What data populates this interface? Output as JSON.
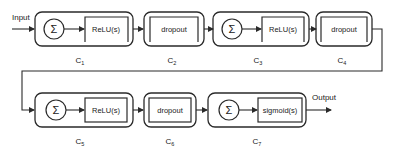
{
  "diagram": {
    "input_label": "Input",
    "output_label": "Output",
    "colors": {
      "stroke": "#2a2a2a",
      "background": "#ffffff",
      "text": "#222222"
    },
    "sum_symbol": "Σ",
    "blocks": [
      {
        "id": "C1",
        "label_main": "C",
        "label_sub": "1",
        "type": "sum-activation",
        "activation": "ReLU(s)"
      },
      {
        "id": "C2",
        "label_main": "C",
        "label_sub": "2",
        "type": "dropout",
        "activation": "dropout"
      },
      {
        "id": "C3",
        "label_main": "C",
        "label_sub": "3",
        "type": "sum-activation",
        "activation": "ReLU(s)"
      },
      {
        "id": "C4",
        "label_main": "C",
        "label_sub": "4",
        "type": "dropout",
        "activation": "dropout"
      },
      {
        "id": "C5",
        "label_main": "C",
        "label_sub": "5",
        "type": "sum-activation",
        "activation": "ReLU(s)"
      },
      {
        "id": "C6",
        "label_main": "C",
        "label_sub": "6",
        "type": "dropout",
        "activation": "dropout"
      },
      {
        "id": "C7",
        "label_main": "C",
        "label_sub": "7",
        "type": "sum-activation",
        "activation": "sigmoid(s)"
      }
    ]
  }
}
